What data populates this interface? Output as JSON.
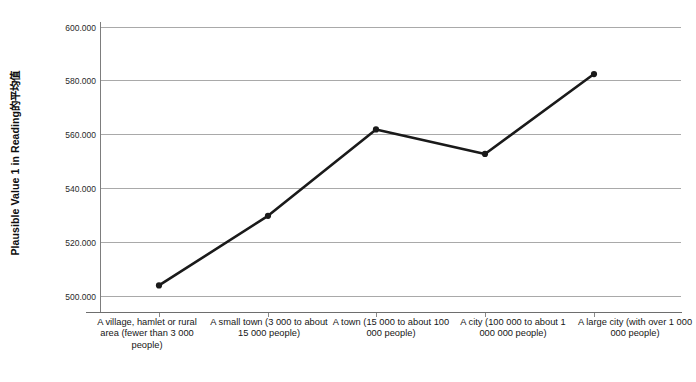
{
  "chart_data": {
    "type": "line",
    "title": "",
    "subtitle": "",
    "xlabel": "",
    "ylabel": "Plausible Value 1 in Reading的平均值",
    "categories": [
      "A village, hamlet or rural area (fewer than 3 000 people)",
      "A small town (3 000 to about 15 000 people)",
      "A town (15 000 to about 100 000 people)",
      "A city (100 000 to about 1 000 000 people)",
      "A large city (with over 1 000 000 people)"
    ],
    "values": [
      504.1,
      530.0,
      562.1,
      553.0,
      582.7
    ],
    "value_labels": [
      "504.100",
      "530.000",
      "562.100",
      "553.000",
      "582.700"
    ],
    "ylim": [
      500.0,
      600.0
    ],
    "ytick_values": [
      500.0,
      520.0,
      540.0,
      560.0,
      580.0,
      600.0
    ],
    "ytick_labels": [
      "500.000",
      "520.000",
      "540.000",
      "560.000",
      "580.000",
      "600.000"
    ],
    "grid": true,
    "legend": false,
    "legend_position": "none",
    "series": [
      {
        "name": "Plausible Value 1 in Reading的平均值",
        "values": [
          504.1,
          530.0,
          562.1,
          553.0,
          582.7
        ]
      }
    ],
    "colors": {
      "line": "#1a1a1a",
      "marker": "#1a1a1a",
      "gridline": "#a9a9a9",
      "axis": "#6e6e6e",
      "background": "#ffffff",
      "text": "#161616"
    },
    "line_width": 2.6,
    "marker": "circle",
    "marker_size": 5
  }
}
